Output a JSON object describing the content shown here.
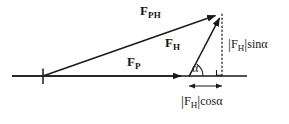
{
  "figure": {
    "type": "vector-diagram",
    "background_color": "#ffffff",
    "stroke_color": "#1a1a1a",
    "width": 289,
    "height": 124
  },
  "labels": {
    "f_ph": {
      "symbol": "F",
      "subscript": "PH",
      "text": "F_PH"
    },
    "f_h": {
      "symbol": "F",
      "subscript": "H",
      "text": "F_H"
    },
    "f_p": {
      "symbol": "F",
      "subscript": "P",
      "text": "F_P"
    },
    "alpha": "α",
    "sin_component": {
      "bar_open": "|",
      "symbol": "F",
      "subscript": "H",
      "bar_close": "|",
      "trig": "sinα",
      "text": "|F_H|sinα"
    },
    "cos_component": {
      "bar_open": "|",
      "symbol": "F",
      "subscript": "H",
      "bar_close": "|",
      "trig": "cosα",
      "text": "|F_H|cosα"
    }
  },
  "geometry": {
    "axis": {
      "x1": 12,
      "y1": 76,
      "x2": 247,
      "y2": 76
    },
    "origin_tick": {
      "x": 43,
      "y_top": 68,
      "y_bottom": 84
    },
    "vector_fph": {
      "x1": 43,
      "y1": 76,
      "x2": 222,
      "y2": 13
    },
    "vector_fh": {
      "x1": 189,
      "y1": 76,
      "x2": 222,
      "y2": 13
    },
    "vector_fp": {
      "x1": 12,
      "y1": 76,
      "x2": 188,
      "y2": 76
    },
    "dotted_drop_line": {
      "x": 222,
      "y_top": 14,
      "y_bottom": 76
    },
    "dimension_arrow": {
      "x1": 188,
      "x2": 223,
      "y": 86
    },
    "right_angle_marker": {
      "x": 222,
      "y": 76
    },
    "angle_arc": {
      "cx": 189,
      "cy": 76,
      "radius": 14
    }
  }
}
